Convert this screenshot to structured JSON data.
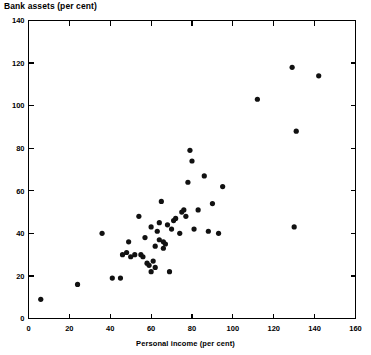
{
  "chart_data": {
    "type": "scatter",
    "title": "Bank assets (per cent)",
    "xlabel": "Personal income (per cent)",
    "ylabel": "Bank assets (per cent)",
    "xlim": [
      0,
      160
    ],
    "ylim": [
      0,
      140
    ],
    "xticks": [
      0,
      20,
      40,
      60,
      80,
      100,
      120,
      140,
      160
    ],
    "yticks": [
      0,
      20,
      40,
      60,
      80,
      100,
      120,
      140
    ],
    "grid": false,
    "legend": null,
    "marker": "filled-circle",
    "marker_color": "#111111",
    "points": [
      {
        "x": 6,
        "y": 9
      },
      {
        "x": 24,
        "y": 16
      },
      {
        "x": 36,
        "y": 40
      },
      {
        "x": 41,
        "y": 19
      },
      {
        "x": 45,
        "y": 19
      },
      {
        "x": 46,
        "y": 30
      },
      {
        "x": 48,
        "y": 31
      },
      {
        "x": 49,
        "y": 36
      },
      {
        "x": 50,
        "y": 29
      },
      {
        "x": 52,
        "y": 30
      },
      {
        "x": 54,
        "y": 48
      },
      {
        "x": 55,
        "y": 30
      },
      {
        "x": 56,
        "y": 29
      },
      {
        "x": 57,
        "y": 38
      },
      {
        "x": 58,
        "y": 26
      },
      {
        "x": 59,
        "y": 25
      },
      {
        "x": 60,
        "y": 22
      },
      {
        "x": 60,
        "y": 43
      },
      {
        "x": 61,
        "y": 27
      },
      {
        "x": 62,
        "y": 24
      },
      {
        "x": 62,
        "y": 34
      },
      {
        "x": 63,
        "y": 41
      },
      {
        "x": 64,
        "y": 37
      },
      {
        "x": 64,
        "y": 45
      },
      {
        "x": 65,
        "y": 55
      },
      {
        "x": 66,
        "y": 33
      },
      {
        "x": 66,
        "y": 36
      },
      {
        "x": 67,
        "y": 35
      },
      {
        "x": 68,
        "y": 44
      },
      {
        "x": 69,
        "y": 22
      },
      {
        "x": 70,
        "y": 42
      },
      {
        "x": 71,
        "y": 46
      },
      {
        "x": 72,
        "y": 47
      },
      {
        "x": 74,
        "y": 40
      },
      {
        "x": 75,
        "y": 50
      },
      {
        "x": 76,
        "y": 51
      },
      {
        "x": 77,
        "y": 48
      },
      {
        "x": 78,
        "y": 64
      },
      {
        "x": 79,
        "y": 79
      },
      {
        "x": 80,
        "y": 74
      },
      {
        "x": 81,
        "y": 42
      },
      {
        "x": 83,
        "y": 51
      },
      {
        "x": 86,
        "y": 67
      },
      {
        "x": 88,
        "y": 41
      },
      {
        "x": 90,
        "y": 54
      },
      {
        "x": 93,
        "y": 40
      },
      {
        "x": 95,
        "y": 62
      },
      {
        "x": 112,
        "y": 103
      },
      {
        "x": 129,
        "y": 118
      },
      {
        "x": 130,
        "y": 43
      },
      {
        "x": 131,
        "y": 88
      },
      {
        "x": 142,
        "y": 114
      }
    ]
  }
}
